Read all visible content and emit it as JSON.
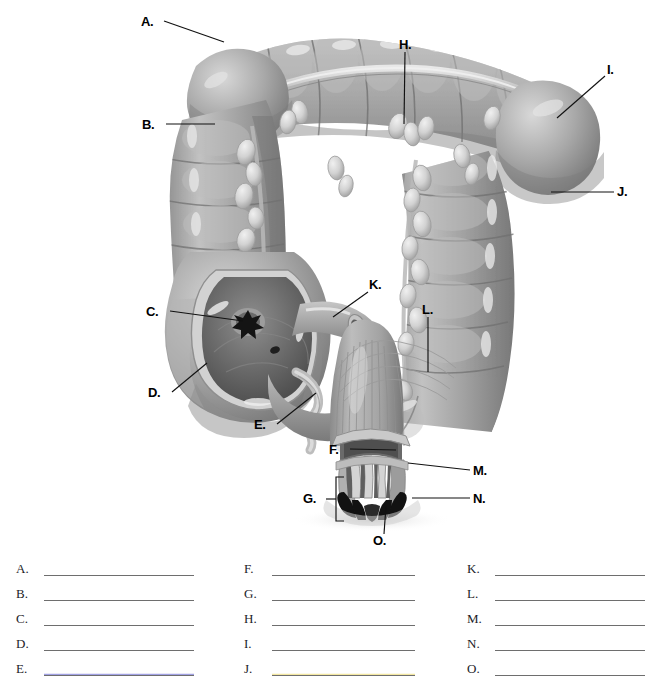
{
  "document": {
    "type": "anatomy-labeling-worksheet",
    "subject": "Large intestine (colon), cecum and anal canal",
    "illustration_style": "grayscale medical illustration"
  },
  "figure": {
    "name": "large-intestine-diagram",
    "callouts": [
      {
        "id": "A",
        "label": "A.",
        "x": 143,
        "y": 15,
        "target_x": 224,
        "target_y": 42,
        "leader": "line"
      },
      {
        "id": "B",
        "label": "B.",
        "x": 144,
        "y": 118,
        "target_x": 215,
        "target_y": 124,
        "leader": "line"
      },
      {
        "id": "C",
        "label": "C.",
        "x": 148,
        "y": 306,
        "target_x": 247,
        "target_y": 321,
        "leader": "line"
      },
      {
        "id": "D",
        "label": "D.",
        "x": 150,
        "y": 392,
        "target_x": 205,
        "target_y": 364,
        "leader": "line"
      },
      {
        "id": "E",
        "label": "E.",
        "x": 256,
        "y": 423,
        "target_x": 315,
        "target_y": 392,
        "leader": "line"
      },
      {
        "id": "F",
        "label": "F.",
        "x": 330,
        "y": 443,
        "target_x": 395,
        "target_y": 450,
        "leader": "line"
      },
      {
        "id": "G",
        "label": "G.",
        "x": 305,
        "y": 492,
        "target_x": 345,
        "target_y": 499,
        "leader": "bracket"
      },
      {
        "id": "H",
        "label": "H.",
        "x": 400,
        "y": 38,
        "target_x": 404,
        "target_y": 124,
        "leader": "line"
      },
      {
        "id": "I",
        "label": "I.",
        "x": 608,
        "y": 69,
        "target_x": 557,
        "target_y": 118,
        "leader": "line"
      },
      {
        "id": "J",
        "label": "J.",
        "x": 618,
        "y": 185,
        "target_x": 551,
        "target_y": 192,
        "leader": "line"
      },
      {
        "id": "K",
        "label": "K.",
        "x": 370,
        "y": 284,
        "target_x": 332,
        "target_y": 316,
        "leader": "line"
      },
      {
        "id": "L",
        "label": "L.",
        "x": 423,
        "y": 303,
        "target_x": 427,
        "target_y": 371,
        "leader": "line"
      },
      {
        "id": "M",
        "label": "M.",
        "x": 474,
        "y": 466,
        "target_x": 409,
        "target_y": 464,
        "leader": "line"
      },
      {
        "id": "N",
        "label": "N.",
        "x": 474,
        "y": 493,
        "target_x": 412,
        "target_y": 499,
        "leader": "line"
      },
      {
        "id": "O",
        "label": "O.",
        "x": 374,
        "y": 536,
        "target_x": 385,
        "target_y": 505,
        "leader": "line"
      }
    ]
  },
  "answers": {
    "columns": [
      {
        "name": "answer-column-1",
        "rows": [
          {
            "letter": "A.",
            "value": "",
            "tint": "blue-none"
          },
          {
            "letter": "B.",
            "value": "",
            "tint": "none"
          },
          {
            "letter": "C.",
            "value": "",
            "tint": "none"
          },
          {
            "letter": "D.",
            "value": "",
            "tint": "none"
          },
          {
            "letter": "E.",
            "value": "",
            "tint": "blue"
          }
        ]
      },
      {
        "name": "answer-column-2",
        "rows": [
          {
            "letter": "F.",
            "value": "",
            "tint": "none"
          },
          {
            "letter": "G.",
            "value": "",
            "tint": "none"
          },
          {
            "letter": "H.",
            "value": "",
            "tint": "none"
          },
          {
            "letter": "I.",
            "value": "",
            "tint": "none"
          },
          {
            "letter": "J.",
            "value": "",
            "tint": "yellow"
          }
        ]
      },
      {
        "name": "answer-column-3",
        "rows": [
          {
            "letter": "K.",
            "value": "",
            "tint": "none"
          },
          {
            "letter": "L.",
            "value": "",
            "tint": "none"
          },
          {
            "letter": "M.",
            "value": "",
            "tint": "none"
          },
          {
            "letter": "N.",
            "value": "",
            "tint": "none"
          },
          {
            "letter": "O.",
            "value": "",
            "tint": "none"
          }
        ]
      }
    ]
  },
  "colors": {
    "background": "#ffffff",
    "line": "#6e6e6e",
    "text": "#1c1c28",
    "callout_text": "#000000",
    "tissue_mid": "#9a9a9a",
    "tissue_light": "#c9c9c9",
    "tissue_highlight": "#e4e4e4",
    "tissue_dark": "#6d6d6d",
    "tissue_shadow": "#4a4a4a",
    "lumen_dark": "#555555",
    "appendage_light": "#dcdcdc",
    "tint_blue": "#8b8bdd",
    "tint_yellow": "#efe08a"
  }
}
